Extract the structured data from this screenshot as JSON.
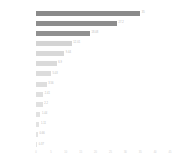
{
  "chart_data": {
    "type": "bar",
    "orientation": "horizontal",
    "title": "",
    "xlabel": "",
    "ylabel": "",
    "grid": false,
    "legend": null,
    "xlim": [
      0,
      45
    ],
    "categories": [
      "",
      "",
      "",
      "",
      "",
      "",
      "",
      "",
      "",
      "",
      "",
      "",
      "",
      ""
    ],
    "values": [
      35.0,
      27.2,
      18.08,
      12.01,
      9.44,
      6.9,
      5.03,
      3.56,
      2.41,
      2.2,
      1.44,
      1.11,
      0.66,
      0.37
    ],
    "value_labels": [
      "35",
      "27.2",
      "18.08",
      "12.01",
      "9.44",
      "6.9",
      "5.03",
      "3.56",
      "2.41",
      "2.2",
      "1.44",
      "1.11",
      "0.66",
      "0.37"
    ],
    "bar_colors": [
      "#8a8a8a",
      "#8d8d8d",
      "#909090",
      "#d4d4d4",
      "#d8d8d8",
      "#dadada",
      "#dcdcdc",
      "#dedede",
      "#e0e0e0",
      "#e1e1e1",
      "#e2e2e2",
      "#e3e3e3",
      "#e4e4e4",
      "#e5e5e5"
    ],
    "xticks": [
      0,
      5,
      10,
      15,
      20,
      25,
      30,
      35,
      40,
      45
    ],
    "xtick_labels": [
      "0",
      "5",
      "10",
      "15",
      "20",
      "25",
      "30",
      "35",
      "40",
      "45"
    ]
  }
}
